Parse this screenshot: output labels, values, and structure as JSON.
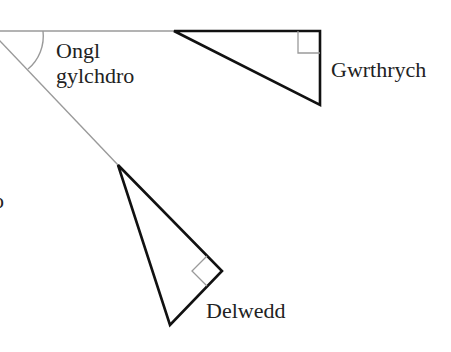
{
  "diagram": {
    "type": "rotation-geometry",
    "labels": {
      "angle_line1": "Ongl",
      "angle_line2": "gylchdro",
      "object": "Gwrthrych",
      "image": "Delwedd",
      "left_edge_fragment": "o"
    },
    "colors": {
      "shape_stroke": "#111111",
      "guide_stroke": "#9a9a9a",
      "text": "#222222",
      "background": "#ffffff"
    },
    "elements": {
      "object_shape": "right-triangle",
      "image_shape": "right-triangle",
      "angle_marker": "arc",
      "right_angle_markers": 2
    }
  }
}
